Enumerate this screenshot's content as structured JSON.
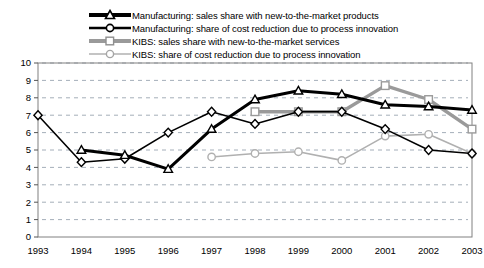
{
  "chart_data": {
    "type": "line",
    "title": "",
    "subtitle": "",
    "xlabel": "",
    "ylabel": "",
    "categories": [
      "1993",
      "1994",
      "1995",
      "1996",
      "1997",
      "1998",
      "1999",
      "2000",
      "2001",
      "2002",
      "2003"
    ],
    "x": [
      1993,
      1994,
      1995,
      1996,
      1997,
      1998,
      1999,
      2000,
      2001,
      2002,
      2003
    ],
    "ylim": [
      0,
      10
    ],
    "xlim": [
      1993,
      2003
    ],
    "yticks": [
      0,
      1,
      2,
      3,
      4,
      5,
      6,
      7,
      8,
      9,
      10
    ],
    "grid": true,
    "grid_style": "dashed-horizontal",
    "legend_position": "top-center",
    "series": [
      {
        "name": "Manufacturing: sales share with new-to-the-market products",
        "color": "#000000",
        "line_width": 3,
        "marker": "triangle",
        "values": [
          null,
          5.0,
          4.7,
          3.9,
          6.2,
          7.9,
          8.4,
          8.2,
          7.6,
          7.5,
          7.3
        ]
      },
      {
        "name": "Manufacturing: share of cost reduction due to process innovation",
        "color": "#000000",
        "line_width": 1.6,
        "marker": "diamond",
        "values": [
          7.0,
          4.3,
          4.5,
          6.0,
          7.2,
          6.5,
          7.2,
          7.2,
          6.2,
          5.0,
          4.8
        ]
      },
      {
        "name": "KIBS: sales share with new-to-the-market services",
        "color": "#9a9a9a",
        "line_width": 3.4,
        "marker": "square",
        "values": [
          null,
          null,
          null,
          null,
          null,
          7.2,
          7.2,
          7.2,
          8.7,
          7.9,
          6.2
        ]
      },
      {
        "name": "KIBS: share of cost reduction due to process innovation",
        "color": "#b0b0b0",
        "line_width": 1.6,
        "marker": "circle",
        "values": [
          null,
          null,
          null,
          null,
          4.6,
          4.8,
          4.9,
          4.4,
          5.8,
          5.9,
          4.8
        ]
      }
    ]
  },
  "legend": {
    "items": [
      {
        "label": "Manufacturing: sales share with new-to-the-market products",
        "marker": "triangle",
        "color": "#000000",
        "line_width": 4
      },
      {
        "label": "Manufacturing: share of cost reduction due to process innovation",
        "marker": "circle",
        "color": "#000000",
        "line_width": 2.4
      },
      {
        "label": "KIBS: sales share with new-to-the-market services",
        "marker": "square",
        "color": "#9a9a9a",
        "line_width": 4
      },
      {
        "label": "KIBS: share of cost reduction due to process innovation",
        "marker": "circle",
        "color": "#b0b0b0",
        "line_width": 1.6
      }
    ]
  },
  "axes": {
    "y_labels": [
      "10",
      "9",
      "8",
      "7",
      "6",
      "5",
      "4",
      "3",
      "2",
      "1",
      "0"
    ],
    "x_labels": [
      "1993",
      "1994",
      "1995",
      "1996",
      "1997",
      "1998",
      "1999",
      "2000",
      "2001",
      "2002",
      "2003"
    ]
  },
  "colors": {
    "plot_border": "#808080",
    "gridline": "#9aa5b1",
    "background": "#ffffff",
    "series_dark": "#000000",
    "series_gray": "#9a9a9a",
    "series_light_gray": "#b0b0b0"
  }
}
